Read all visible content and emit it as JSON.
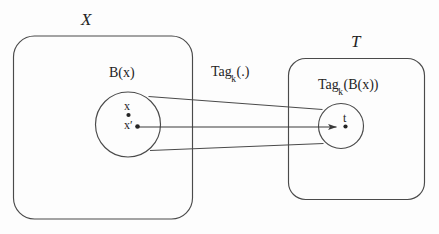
{
  "figure": {
    "kind": "set-mapping-diagram",
    "background_color": "#fdfdfd",
    "stroke_color": "#3a3a3a",
    "text_color": "#242424",
    "domain_set": {
      "label": "X",
      "ball": {
        "label": "B(x)",
        "points": [
          {
            "label": "x",
            "name": "point-x"
          },
          {
            "label": "x′",
            "name": "point-x-prime"
          }
        ]
      }
    },
    "codomain_set": {
      "label": "T",
      "ball": {
        "label_main": "Tag",
        "label_sub": "k",
        "label_tail": "(B(x))",
        "label": "Tag_k(B(x))",
        "points": [
          {
            "label": "t",
            "name": "point-t"
          }
        ]
      }
    },
    "mapping": {
      "label_main": "Tag",
      "label_sub": "k",
      "label_tail": "(.)",
      "label": "Tag_k(.)"
    }
  }
}
